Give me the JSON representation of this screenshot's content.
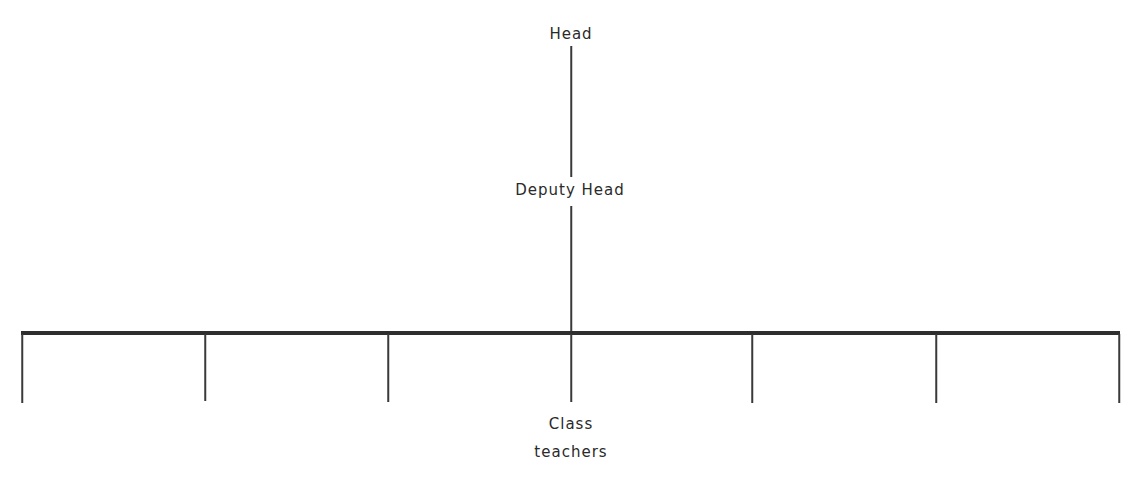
{
  "diagram": {
    "type": "org-chart",
    "nodes": {
      "head": {
        "label": "Head",
        "x": 571,
        "y": 25
      },
      "deputy": {
        "label": "Deputy Head",
        "x": 570,
        "y": 181
      },
      "class_teachers": {
        "line1": "Class",
        "line2": "teachers",
        "x": 571,
        "y1": 415,
        "y2": 443
      }
    },
    "connectors": {
      "head_to_deputy": {
        "x": 571,
        "top": 46,
        "bottom": 177
      },
      "deputy_to_bar": {
        "x": 571,
        "top": 206,
        "bottom": 333
      }
    },
    "bar": {
      "left": 21,
      "right": 1120,
      "top": 331,
      "thickness": 4
    },
    "drops": [
      {
        "x": 22,
        "top": 334,
        "bottom": 403
      },
      {
        "x": 205,
        "top": 334,
        "bottom": 401
      },
      {
        "x": 388,
        "top": 334,
        "bottom": 402
      },
      {
        "x": 571,
        "top": 334,
        "bottom": 402
      },
      {
        "x": 752,
        "top": 334,
        "bottom": 403
      },
      {
        "x": 936,
        "top": 334,
        "bottom": 403
      },
      {
        "x": 1119,
        "top": 334,
        "bottom": 403
      }
    ],
    "colors": {
      "line": "#3a3a3a",
      "bar": "#2e2e2e",
      "text": "#2a2a2a",
      "background": "#ffffff"
    }
  }
}
